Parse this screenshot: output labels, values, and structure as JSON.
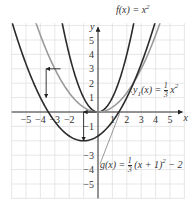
{
  "chart_data": {
    "type": "line",
    "title": "",
    "xlabel": "x",
    "ylabel": "y",
    "xlim": [
      -6,
      6
    ],
    "ylim": [
      -6,
      6
    ],
    "grid": true,
    "x_ticks": [
      -5,
      -4,
      -3,
      -2,
      1,
      2,
      3,
      4,
      5
    ],
    "y_ticks": [
      5,
      4,
      3,
      2,
      1,
      -1,
      -3,
      -4,
      -5
    ],
    "series": [
      {
        "name": "f(x) = x^2",
        "expr": "x^2",
        "color": "#2b2b2b",
        "a": 1,
        "h": 0,
        "k": 0
      },
      {
        "name": "y1(x) = (1/3)x^2",
        "expr": "(1/3)x^2",
        "color": "#9a9a9a",
        "a": 0.3333,
        "h": 0,
        "k": 0
      },
      {
        "name": "g(x) = (1/3)(x+1)^2 - 2",
        "expr": "(1/3)(x+1)^2 - 2",
        "color": "#2b2b2b",
        "a": 0.3333,
        "h": -1,
        "k": -2
      }
    ],
    "annotations": [
      {
        "type": "arrow",
        "from": [
          -2.6,
          3
        ],
        "to": [
          -3.6,
          3
        ],
        "meaning": "shift left 1"
      },
      {
        "type": "arrow",
        "from": [
          -3.6,
          3
        ],
        "to": [
          -3.6,
          1
        ],
        "meaning": "shift down 2"
      },
      {
        "type": "arrow",
        "from": [
          -0.1,
          0
        ],
        "to": [
          -1,
          0
        ],
        "meaning": "shift left 1"
      },
      {
        "type": "arrow",
        "from": [
          -1,
          0
        ],
        "to": [
          -1,
          -2
        ],
        "meaning": "shift down 2"
      }
    ]
  },
  "labels": {
    "f": "f(x) = x",
    "f_exp": "2",
    "y1_pre": "y",
    "y1_sub": "1",
    "y1_mid": "(x) = ",
    "y1_num": "1",
    "y1_den": "3",
    "y1_post": "x",
    "y1_exp": "2",
    "g_pre": "g(x) = ",
    "g_num": "1",
    "g_den": "3",
    "g_post": "(x + 1)",
    "g_exp": "2",
    "g_tail": " − 2",
    "x_axis": "x",
    "y_axis": "y"
  }
}
